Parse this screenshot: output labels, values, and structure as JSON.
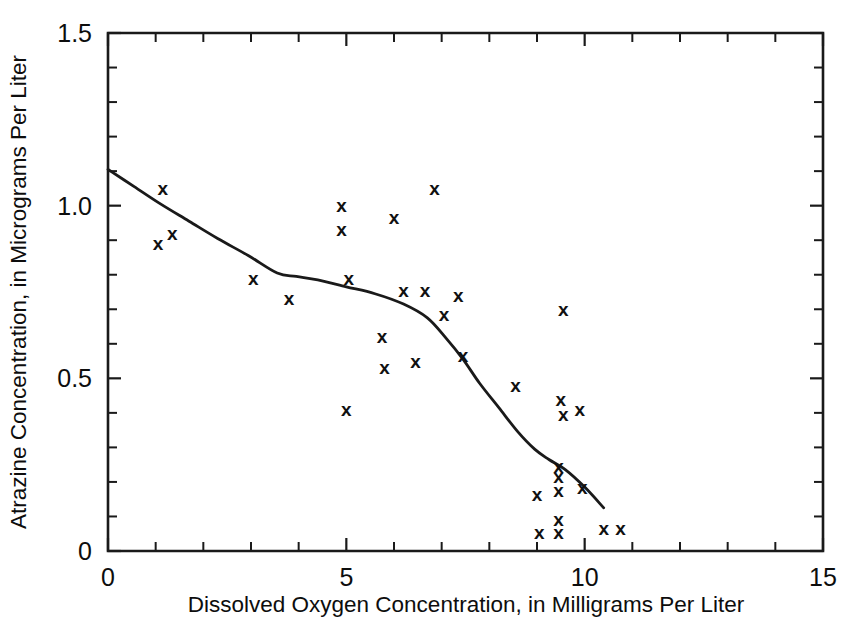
{
  "chart_data": {
    "type": "scatter",
    "title": "",
    "xlabel": "Dissolved Oxygen Concentration, in Milligrams Per Liter",
    "ylabel": "Atrazine Concentration, in Micrograms Per Liter",
    "xlim": [
      0,
      15
    ],
    "ylim": [
      0,
      1.5
    ],
    "grid": false,
    "legend": "none",
    "marker": "x",
    "x_ticks_major": [
      0,
      5,
      10,
      15
    ],
    "x_tick_labels": [
      "0",
      "5",
      "10",
      "15"
    ],
    "x_ticks_minor": [
      1,
      2,
      3,
      4,
      6,
      7,
      8,
      9,
      11,
      12,
      13,
      14
    ],
    "y_ticks_major": [
      0,
      0.5,
      1.0,
      1.5
    ],
    "y_tick_labels": [
      "0",
      "0.5",
      "1.0",
      "1.5"
    ],
    "y_ticks_minor": [
      0.1,
      0.2,
      0.3,
      0.4,
      0.6,
      0.7,
      0.8,
      0.9,
      1.1,
      1.2,
      1.3,
      1.4
    ],
    "points": [
      {
        "x": 1.05,
        "y": 0.89
      },
      {
        "x": 1.15,
        "y": 1.05
      },
      {
        "x": 1.35,
        "y": 0.92
      },
      {
        "x": 3.05,
        "y": 0.79
      },
      {
        "x": 3.8,
        "y": 0.73
      },
      {
        "x": 4.9,
        "y": 1.0
      },
      {
        "x": 4.9,
        "y": 0.93
      },
      {
        "x": 5.0,
        "y": 0.41
      },
      {
        "x": 5.05,
        "y": 0.79
      },
      {
        "x": 5.75,
        "y": 0.62
      },
      {
        "x": 5.8,
        "y": 0.53
      },
      {
        "x": 6.0,
        "y": 0.965
      },
      {
        "x": 6.2,
        "y": 0.755
      },
      {
        "x": 6.45,
        "y": 0.55
      },
      {
        "x": 6.65,
        "y": 0.755
      },
      {
        "x": 6.85,
        "y": 1.05
      },
      {
        "x": 7.05,
        "y": 0.685
      },
      {
        "x": 7.35,
        "y": 0.74
      },
      {
        "x": 7.45,
        "y": 0.565
      },
      {
        "x": 8.55,
        "y": 0.48
      },
      {
        "x": 9.0,
        "y": 0.165
      },
      {
        "x": 9.05,
        "y": 0.055
      },
      {
        "x": 9.45,
        "y": 0.245
      },
      {
        "x": 9.45,
        "y": 0.215
      },
      {
        "x": 9.45,
        "y": 0.175
      },
      {
        "x": 9.45,
        "y": 0.09
      },
      {
        "x": 9.45,
        "y": 0.055
      },
      {
        "x": 9.5,
        "y": 0.44
      },
      {
        "x": 9.55,
        "y": 0.395
      },
      {
        "x": 9.55,
        "y": 0.7
      },
      {
        "x": 9.9,
        "y": 0.41
      },
      {
        "x": 9.95,
        "y": 0.185
      },
      {
        "x": 10.4,
        "y": 0.065
      },
      {
        "x": 10.75,
        "y": 0.065
      }
    ],
    "trend_line": {
      "name": "smoothed trend",
      "x": [
        0.0,
        0.55,
        1.1,
        1.7,
        2.3,
        2.95,
        3.55,
        3.95,
        4.4,
        5.0,
        5.6,
        6.2,
        6.7,
        7.1,
        7.45,
        7.8,
        8.2,
        8.6,
        8.95,
        9.25,
        9.6,
        10.0,
        10.4
      ],
      "y": [
        1.105,
        1.055,
        1.005,
        0.955,
        0.905,
        0.855,
        0.805,
        0.795,
        0.785,
        0.765,
        0.745,
        0.715,
        0.675,
        0.615,
        0.555,
        0.485,
        0.415,
        0.345,
        0.295,
        0.265,
        0.235,
        0.185,
        0.125
      ]
    }
  },
  "figure": {
    "background_color": "#ffffff",
    "ink_color": "#1a1a1a"
  }
}
